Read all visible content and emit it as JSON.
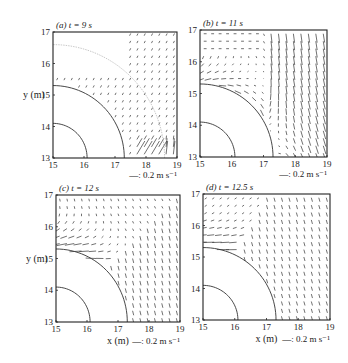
{
  "figure": {
    "panels": [
      {
        "id": "a",
        "label": "(a)",
        "time": "t = 9 s",
        "frame": [
          53,
          32,
          177,
          158
        ],
        "show_ylabel": true,
        "show_xlabel": false,
        "scale": "—: 0.2 m s⁻¹"
      },
      {
        "id": "b",
        "label": "(b)",
        "time": "t = 11 s",
        "frame": [
          200,
          30,
          327,
          157
        ],
        "show_ylabel": false,
        "show_xlabel": false,
        "scale": "—: 0.2 m s⁻¹"
      },
      {
        "id": "c",
        "label": "(c)",
        "time": "t = 12 s",
        "frame": [
          56,
          195,
          180,
          322
        ],
        "show_ylabel": true,
        "show_xlabel": true,
        "scale": "—: 0.2 m s⁻¹"
      },
      {
        "id": "d",
        "label": "(d)",
        "time": "t = 12.5 s",
        "frame": [
          203,
          194,
          330,
          320
        ],
        "show_ylabel": false,
        "show_xlabel": true,
        "scale": "—: 0.2 m s⁻¹"
      }
    ]
  },
  "chart_data": [
    {
      "type": "quiver",
      "title": "(a) t = 9 s",
      "xlabel": "",
      "ylabel": "y (m)",
      "xlim": [
        15,
        19
      ],
      "ylim": [
        13,
        17
      ],
      "xticks": [
        15,
        16,
        17,
        18,
        19
      ],
      "yticks": [
        13,
        14,
        15,
        16,
        17
      ],
      "reference_vector": "0.2 m s⁻¹",
      "contours": [
        {
          "center": [
            15,
            13
          ],
          "radius": 1.1
        },
        {
          "center": [
            15,
            13
          ],
          "radius": 2.3
        },
        {
          "center": [
            15,
            13
          ],
          "radius": 3.6,
          "style": "dotted"
        }
      ],
      "flow": "weak vectors outside r≈2.3; stronger upward/diagonal vectors near x=17.5–19, y=13–13.6"
    },
    {
      "type": "quiver",
      "title": "(b) t = 11 s",
      "xlabel": "",
      "ylabel": "",
      "xlim": [
        15,
        19
      ],
      "ylim": [
        13,
        17
      ],
      "xticks": [
        15,
        16,
        17,
        18,
        19
      ],
      "yticks": [
        13,
        14,
        15,
        16,
        17
      ],
      "reference_vector": "0.2 m s⁻¹",
      "contours": [
        {
          "center": [
            15,
            13
          ],
          "radius": 1.1
        },
        {
          "center": [
            15,
            13
          ],
          "radius": 2.3
        }
      ],
      "flow": "strong arching vectors around outer arc, largest near (16.3,14.8); diagonal flow lower right"
    },
    {
      "type": "quiver",
      "title": "(c) t = 12 s",
      "xlabel": "x (m)",
      "ylabel": "y (m)",
      "xlim": [
        15,
        19
      ],
      "ylim": [
        13,
        17
      ],
      "xticks": [
        15,
        16,
        17,
        18,
        19
      ],
      "yticks": [
        13,
        14,
        15,
        16,
        17
      ],
      "reference_vector": "0.2 m s⁻¹",
      "contours": [
        {
          "center": [
            15,
            13
          ],
          "radius": 1.1
        },
        {
          "center": [
            15,
            13
          ],
          "radius": 2.3
        }
      ],
      "flow": "strong vectors near (15.3,15.3) along arc; weak downward vectors lower right"
    },
    {
      "type": "quiver",
      "title": "(d) t = 12.5 s",
      "xlabel": "x (m)",
      "ylabel": "",
      "xlim": [
        15,
        19
      ],
      "ylim": [
        13,
        17
      ],
      "xticks": [
        15,
        16,
        17,
        18,
        19
      ],
      "yticks": [
        13,
        14,
        15,
        16,
        17
      ],
      "reference_vector": "0.2 m s⁻¹",
      "contours": [
        {
          "center": [
            15,
            13
          ],
          "radius": 1.1
        },
        {
          "center": [
            15,
            13
          ],
          "radius": 2.3
        }
      ],
      "flow": "strong horizontal vectors near (15,15.3); weak vectors elsewhere"
    }
  ]
}
